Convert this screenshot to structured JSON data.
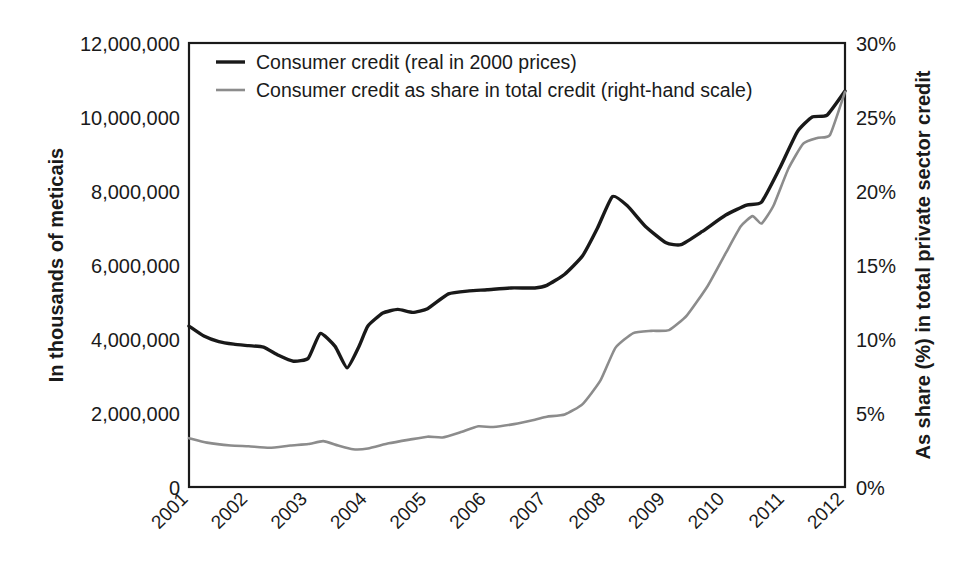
{
  "chart_data": {
    "type": "line",
    "title": "",
    "subtitle": "",
    "xlabel": "",
    "ylabel": "In thousands of meticais",
    "y2label": "As share (%) in total private sector credit",
    "grid": false,
    "legend_position": "top-left-inside",
    "x": [
      2001,
      2002,
      2003,
      2004,
      2005,
      2006,
      2007,
      2008,
      2009,
      2010,
      2011,
      2012
    ],
    "categories": [
      "2001",
      "2002",
      "2003",
      "2004",
      "2005",
      "2006",
      "2007",
      "2008",
      "2009",
      "2010",
      "2011",
      "2012"
    ],
    "xtick_labels": [
      "2001",
      "2002",
      "2003",
      "2004",
      "2005",
      "2006",
      "2007",
      "2008",
      "2009",
      "2010",
      "2011",
      "2012"
    ],
    "xlim": [
      2001,
      2012
    ],
    "ylim": [
      0,
      12000000
    ],
    "ytick_values": [
      0,
      2000000,
      4000000,
      6000000,
      8000000,
      10000000,
      12000000
    ],
    "ytick_labels": [
      "0",
      "2,000,000",
      "4,000,000",
      "6,000,000",
      "8,000,000",
      "10,000,000",
      "12,000,000"
    ],
    "y2lim": [
      0,
      30
    ],
    "y2tick_values": [
      0,
      5,
      10,
      15,
      20,
      25,
      30
    ],
    "y2tick_labels": [
      "0%",
      "5%",
      "10%",
      "15%",
      "20%",
      "25%",
      "30%"
    ],
    "series": [
      {
        "name": "Consumer credit (real in 2000 prices)",
        "axis": "left",
        "color": "#191919",
        "units": "thousands of meticais",
        "points": [
          {
            "x": 2001.0,
            "y": 4350000
          },
          {
            "x": 2001.25,
            "y": 4080000
          },
          {
            "x": 2001.5,
            "y": 3930000
          },
          {
            "x": 2001.75,
            "y": 3860000
          },
          {
            "x": 2002.0,
            "y": 3820000
          },
          {
            "x": 2002.25,
            "y": 3780000
          },
          {
            "x": 2002.5,
            "y": 3560000
          },
          {
            "x": 2002.75,
            "y": 3400000
          },
          {
            "x": 2003.0,
            "y": 3480000
          },
          {
            "x": 2003.2,
            "y": 4150000
          },
          {
            "x": 2003.45,
            "y": 3800000
          },
          {
            "x": 2003.65,
            "y": 3220000
          },
          {
            "x": 2003.85,
            "y": 3800000
          },
          {
            "x": 2004.0,
            "y": 4350000
          },
          {
            "x": 2004.25,
            "y": 4700000
          },
          {
            "x": 2004.5,
            "y": 4800000
          },
          {
            "x": 2004.75,
            "y": 4720000
          },
          {
            "x": 2005.0,
            "y": 4820000
          },
          {
            "x": 2005.35,
            "y": 5220000
          },
          {
            "x": 2005.7,
            "y": 5300000
          },
          {
            "x": 2006.0,
            "y": 5330000
          },
          {
            "x": 2006.4,
            "y": 5380000
          },
          {
            "x": 2006.8,
            "y": 5380000
          },
          {
            "x": 2007.0,
            "y": 5450000
          },
          {
            "x": 2007.3,
            "y": 5750000
          },
          {
            "x": 2007.6,
            "y": 6250000
          },
          {
            "x": 2007.85,
            "y": 7000000
          },
          {
            "x": 2008.1,
            "y": 7850000
          },
          {
            "x": 2008.35,
            "y": 7600000
          },
          {
            "x": 2008.65,
            "y": 7050000
          },
          {
            "x": 2009.0,
            "y": 6600000
          },
          {
            "x": 2009.25,
            "y": 6550000
          },
          {
            "x": 2009.6,
            "y": 6900000
          },
          {
            "x": 2010.0,
            "y": 7350000
          },
          {
            "x": 2010.35,
            "y": 7620000
          },
          {
            "x": 2010.6,
            "y": 7700000
          },
          {
            "x": 2010.9,
            "y": 8600000
          },
          {
            "x": 2011.2,
            "y": 9600000
          },
          {
            "x": 2011.45,
            "y": 10000000
          },
          {
            "x": 2011.7,
            "y": 10050000
          },
          {
            "x": 2012.0,
            "y": 10700000
          }
        ]
      },
      {
        "name": "Consumer credit as share in total credit (right-hand scale)",
        "axis": "right",
        "color": "#8c8c8c",
        "units": "percent",
        "points": [
          {
            "x": 2001.0,
            "y": 3.3
          },
          {
            "x": 2001.3,
            "y": 3.0
          },
          {
            "x": 2001.7,
            "y": 2.8
          },
          {
            "x": 2002.0,
            "y": 2.75
          },
          {
            "x": 2002.35,
            "y": 2.65
          },
          {
            "x": 2002.7,
            "y": 2.8
          },
          {
            "x": 2003.0,
            "y": 2.9
          },
          {
            "x": 2003.25,
            "y": 3.1
          },
          {
            "x": 2003.5,
            "y": 2.8
          },
          {
            "x": 2003.75,
            "y": 2.55
          },
          {
            "x": 2004.0,
            "y": 2.6
          },
          {
            "x": 2004.35,
            "y": 2.95
          },
          {
            "x": 2004.7,
            "y": 3.2
          },
          {
            "x": 2005.0,
            "y": 3.4
          },
          {
            "x": 2005.25,
            "y": 3.35
          },
          {
            "x": 2005.55,
            "y": 3.7
          },
          {
            "x": 2005.85,
            "y": 4.1
          },
          {
            "x": 2006.1,
            "y": 4.05
          },
          {
            "x": 2006.45,
            "y": 4.25
          },
          {
            "x": 2006.8,
            "y": 4.55
          },
          {
            "x": 2007.0,
            "y": 4.75
          },
          {
            "x": 2007.3,
            "y": 4.9
          },
          {
            "x": 2007.6,
            "y": 5.6
          },
          {
            "x": 2007.9,
            "y": 7.2
          },
          {
            "x": 2008.15,
            "y": 9.4
          },
          {
            "x": 2008.45,
            "y": 10.4
          },
          {
            "x": 2008.75,
            "y": 10.55
          },
          {
            "x": 2009.05,
            "y": 10.6
          },
          {
            "x": 2009.35,
            "y": 11.6
          },
          {
            "x": 2009.7,
            "y": 13.6
          },
          {
            "x": 2010.0,
            "y": 15.8
          },
          {
            "x": 2010.25,
            "y": 17.6
          },
          {
            "x": 2010.45,
            "y": 18.3
          },
          {
            "x": 2010.6,
            "y": 17.8
          },
          {
            "x": 2010.8,
            "y": 19.0
          },
          {
            "x": 2011.05,
            "y": 21.5
          },
          {
            "x": 2011.3,
            "y": 23.2
          },
          {
            "x": 2011.55,
            "y": 23.6
          },
          {
            "x": 2011.75,
            "y": 23.8
          },
          {
            "x": 2012.0,
            "y": 26.7
          }
        ]
      }
    ],
    "legend": [
      {
        "label": "Consumer credit (real in 2000 prices)",
        "color": "#191919"
      },
      {
        "label": "Consumer credit as share in total credit (right-hand scale)",
        "color": "#8c8c8c"
      }
    ],
    "annotations": []
  },
  "axes": {
    "left_title": "In thousands of meticais",
    "right_title": "As share (%) in total private sector credit"
  }
}
